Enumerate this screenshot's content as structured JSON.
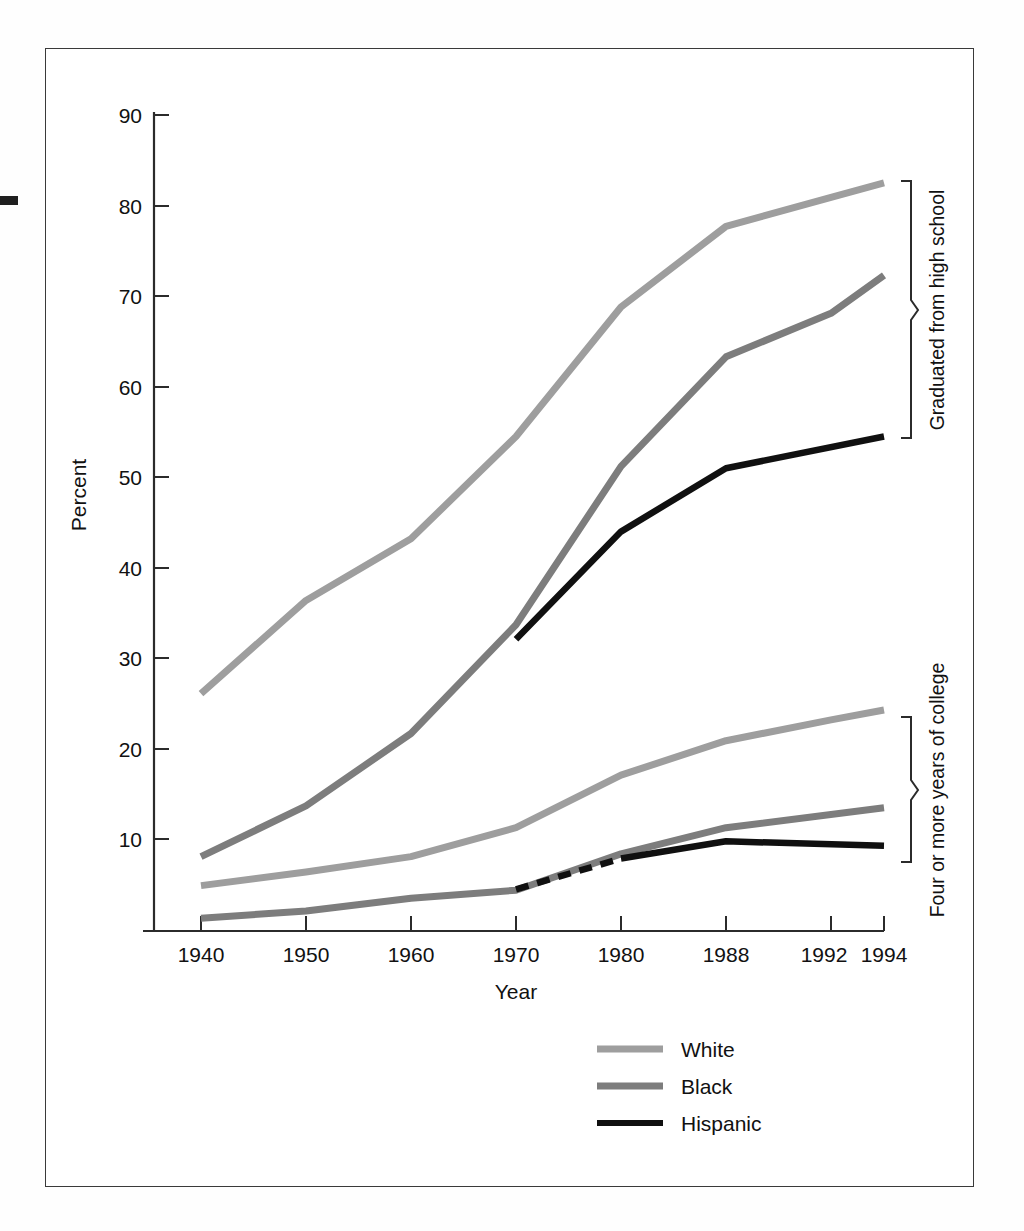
{
  "figure": {
    "y_axis_title": "Percent",
    "x_axis_title": "Year",
    "y_ticks": [
      "10",
      "20",
      "30",
      "40",
      "50",
      "60",
      "70",
      "80",
      "90"
    ],
    "x_ticks": [
      "1940",
      "1950",
      "1960",
      "1970",
      "1980",
      "1988",
      "1992",
      "1994"
    ],
    "group_labels": {
      "upper": "Graduated from high school",
      "lower": "Four or more years of college"
    },
    "legend": [
      {
        "label": "White",
        "color": "#9e9e9e",
        "style": "solid"
      },
      {
        "label": "Black",
        "color": "#7d7d7d",
        "style": "solid"
      },
      {
        "label": "Hispanic",
        "color": "#101010",
        "style": "solid"
      }
    ]
  },
  "chart_data": {
    "type": "line",
    "title": "",
    "xlabel": "Year",
    "ylabel": "Percent",
    "x": [
      1940,
      1950,
      1960,
      1970,
      1980,
      1988,
      1992,
      1994
    ],
    "xtick_labels": [
      "1940",
      "1950",
      "1960",
      "1970",
      "1980",
      "1988",
      "1992",
      "1994"
    ],
    "ylim": [
      0,
      90
    ],
    "ytick_values": [
      10,
      20,
      30,
      40,
      50,
      60,
      70,
      80,
      90
    ],
    "grid": false,
    "legend_position": "bottom-center",
    "annotations": [
      "Graduated from high school",
      "Four or more years of college"
    ],
    "series": [
      {
        "name": "White",
        "group": "Graduated from high school",
        "color": "#9e9e9e",
        "style": "solid",
        "x": [
          1940,
          1950,
          1960,
          1970,
          1980,
          1988,
          1992,
          1994
        ],
        "values": [
          26.1,
          36.4,
          43.2,
          54.5,
          68.8,
          77.7,
          80.9,
          82.5
        ]
      },
      {
        "name": "Black",
        "group": "Graduated from high school",
        "color": "#7d7d7d",
        "style": "solid",
        "x": [
          1940,
          1950,
          1960,
          1970,
          1980,
          1988,
          1992,
          1994
        ],
        "values": [
          8.1,
          13.7,
          21.7,
          33.7,
          51.2,
          63.3,
          68.1,
          72.3
        ]
      },
      {
        "name": "Hispanic",
        "group": "Graduated from high school",
        "color": "#101010",
        "style": "solid",
        "x": [
          1970,
          1980,
          1988,
          1994
        ],
        "values": [
          32.1,
          44.0,
          51.0,
          54.5
        ]
      },
      {
        "name": "White",
        "group": "Four or more years of college",
        "color": "#9e9e9e",
        "style": "solid",
        "x": [
          1940,
          1950,
          1960,
          1970,
          1980,
          1988,
          1992,
          1994
        ],
        "values": [
          4.9,
          6.4,
          8.1,
          11.3,
          17.1,
          20.9,
          23.2,
          24.3
        ]
      },
      {
        "name": "Black",
        "group": "Four or more years of college",
        "color": "#7d7d7d",
        "style": "solid",
        "x": [
          1940,
          1950,
          1960,
          1970,
          1980,
          1988,
          1994
        ],
        "values": [
          1.3,
          2.1,
          3.5,
          4.4,
          8.4,
          11.3,
          13.5
        ]
      },
      {
        "name": "Hispanic",
        "group": "Four or more years of college",
        "color": "#101010",
        "style": "dashed-then-solid",
        "dash_until": 1980,
        "x": [
          1970,
          1980,
          1988,
          1994
        ],
        "values": [
          4.5,
          7.9,
          9.8,
          9.3
        ]
      }
    ]
  }
}
